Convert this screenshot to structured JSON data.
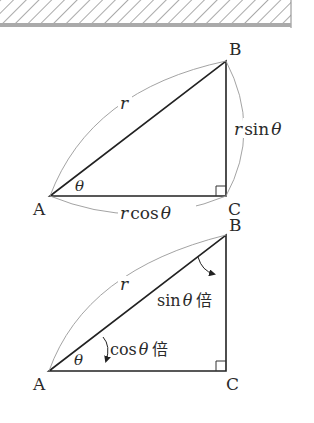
{
  "diagram": {
    "ceiling": {
      "description": "hatched ceiling bar"
    },
    "triangle1": {
      "labels": {
        "A": "A",
        "B": "B",
        "C": "C"
      },
      "hypotenuse": "r",
      "angle": "θ",
      "vertical_side": {
        "var": "r",
        "fn": "sin",
        "theta": "θ"
      },
      "horizontal_side": {
        "var": "r",
        "fn": "cos",
        "theta": "θ"
      }
    },
    "triangle2": {
      "labels": {
        "A": "A",
        "B": "B",
        "C": "C"
      },
      "hypotenuse": "r",
      "angle": "θ",
      "sin_annotation": {
        "fn": "sin",
        "theta": "θ",
        "suffix": "倍"
      },
      "cos_annotation": {
        "fn": "cos",
        "theta": "θ",
        "suffix": "倍"
      }
    }
  }
}
